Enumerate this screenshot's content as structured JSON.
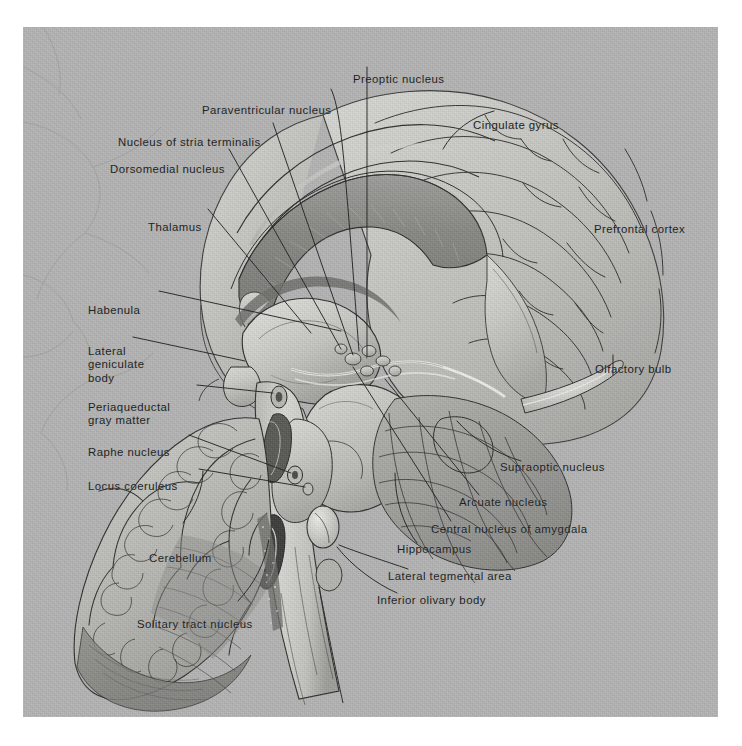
{
  "figure": {
    "domain": "anatomical-illustration",
    "plate_background_color": "#b3b4b3",
    "ink_color": "#16181a",
    "page_color": "#ffffff",
    "plate": {
      "x": 23,
      "y": 27,
      "width": 695,
      "height": 690
    }
  },
  "labels": {
    "top": [
      {
        "id": "preoptic-nucleus",
        "text": "Preoptic nucleus",
        "x": 330,
        "y": 52,
        "align": "c"
      }
    ],
    "upper_left": [
      {
        "id": "paraventricular-nucleus",
        "text": "Paraventricular nucleus",
        "x": 202,
        "y": 83,
        "align": "l"
      },
      {
        "id": "nucleus-of-stria-terminalis",
        "text": "Nucleus of stria terminalis",
        "x": 118,
        "y": 115,
        "align": "l"
      },
      {
        "id": "dorsomedial-nucleus",
        "text": "Dorsomedial nucleus",
        "x": 110,
        "y": 142,
        "align": "l"
      },
      {
        "id": "thalamus",
        "text": "Thalamus",
        "x": 148,
        "y": 200,
        "align": "l"
      }
    ],
    "left": [
      {
        "id": "habenula",
        "text": "Habenula",
        "x": 88,
        "y": 283,
        "align": "l"
      },
      {
        "id": "lateral-geniculate-body",
        "text": "Lateral\ngeniculate\nbody",
        "x": 88,
        "y": 324,
        "align": "l"
      },
      {
        "id": "periaqueductal-gray-matter",
        "text": "Periaqueductal\ngray matter",
        "x": 88,
        "y": 380,
        "align": "l"
      },
      {
        "id": "raphe-nucleus",
        "text": "Raphe nucleus",
        "x": 88,
        "y": 425,
        "align": "l"
      },
      {
        "id": "locus-coeruleus",
        "text": "Locus coeruleus",
        "x": 88,
        "y": 459,
        "align": "l"
      }
    ],
    "lower_left": [
      {
        "id": "cerebellum",
        "text": "Cerebellum",
        "x": 149,
        "y": 531,
        "align": "l"
      },
      {
        "id": "solitary-tract-nucleus",
        "text": "Solitary tract nucleus",
        "x": 137,
        "y": 597,
        "align": "l"
      }
    ],
    "upper_right": [
      {
        "id": "cingulate-gyrus",
        "text": "Cingulate gyrus",
        "x": 473,
        "y": 98,
        "align": "l"
      },
      {
        "id": "prefrontal-cortex",
        "text": "Prefrontal cortex",
        "x": 594,
        "y": 202,
        "align": "l"
      }
    ],
    "right": [
      {
        "id": "olfactory-bulb",
        "text": "Olfactory bulb",
        "x": 595,
        "y": 342,
        "align": "l"
      },
      {
        "id": "supraoptic-nucleus",
        "text": "Supraoptic nucleus",
        "x": 500,
        "y": 440,
        "align": "l"
      },
      {
        "id": "arcuate-nucleus",
        "text": "Arcuate nucleus",
        "x": 459,
        "y": 475,
        "align": "l"
      },
      {
        "id": "central-nucleus-of-amygdala",
        "text": "Central nucleus of amygdala",
        "x": 431,
        "y": 502,
        "align": "l"
      },
      {
        "id": "hippocampus",
        "text": "Hippocampus",
        "x": 397,
        "y": 522,
        "align": "l"
      },
      {
        "id": "lateral-tegmental-area",
        "text": "Lateral tegmental area",
        "x": 388,
        "y": 549,
        "align": "l"
      },
      {
        "id": "inferior-olivary-body",
        "text": "Inferior olivary body",
        "x": 377,
        "y": 573,
        "align": "l"
      }
    ]
  },
  "structures": [
    {
      "id": "cerebral-cortex",
      "name": "cerebral cortex / gyri"
    },
    {
      "id": "corpus-callosum",
      "name": "corpus callosum"
    },
    {
      "id": "cingulate-gyrus-body",
      "name": "cingulate gyrus"
    },
    {
      "id": "thalamus-body",
      "name": "thalamus"
    },
    {
      "id": "hypothalamus",
      "name": "hypothalamus"
    },
    {
      "id": "midbrain",
      "name": "midbrain / tegmentum"
    },
    {
      "id": "pons",
      "name": "pons"
    },
    {
      "id": "medulla-oblongata",
      "name": "medulla oblongata"
    },
    {
      "id": "cerebellum-body",
      "name": "cerebellum / arbor vitae"
    },
    {
      "id": "fourth-ventricle",
      "name": "fourth ventricle"
    },
    {
      "id": "olfactory-bulb-body",
      "name": "olfactory bulb"
    },
    {
      "id": "amygdala",
      "name": "amygdala"
    },
    {
      "id": "hippocampus-body",
      "name": "hippocampus"
    },
    {
      "id": "inferior-olive",
      "name": "inferior olivary body"
    }
  ]
}
